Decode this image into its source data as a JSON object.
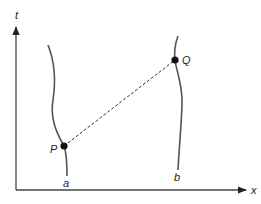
{
  "diagram": {
    "type": "spacetime-diagram",
    "axes": {
      "vertical_label": "t",
      "horizontal_label": "x"
    },
    "worldlines": [
      {
        "name": "a"
      },
      {
        "name": "b"
      }
    ],
    "events": [
      {
        "name": "P",
        "on": "a"
      },
      {
        "name": "Q",
        "on": "b"
      }
    ],
    "connector": {
      "from": "P",
      "to": "Q",
      "style": "dashed"
    },
    "colors": {
      "line": "#444444",
      "dot": "#111111",
      "text": "#222222"
    }
  }
}
